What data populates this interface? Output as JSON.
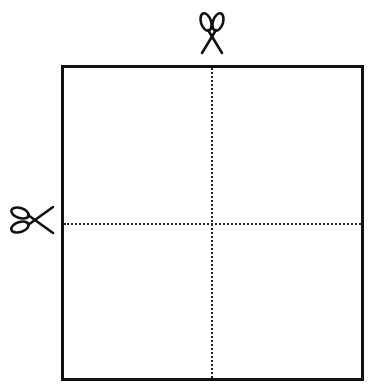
{
  "diagram": {
    "paper": {
      "shape": "square",
      "border_color": "#111111",
      "fill_color": "#ffffff"
    },
    "cut_lines": [
      {
        "orientation": "vertical",
        "position": "center",
        "style": "dotted"
      },
      {
        "orientation": "horizontal",
        "position": "center",
        "style": "dotted"
      }
    ],
    "icons": [
      {
        "name": "scissors-icon",
        "position": "top",
        "pointing": "down"
      },
      {
        "name": "scissors-icon",
        "position": "left",
        "pointing": "right"
      }
    ]
  }
}
